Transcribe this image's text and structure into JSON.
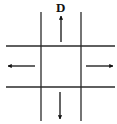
{
  "diagram": {
    "title_label": "D",
    "colors": {
      "line": "#2a2a2a",
      "arrow": "#111111",
      "background": "#ffffff"
    },
    "lines": {
      "vertical": [
        {
          "x": 41,
          "y1": 12,
          "y2": 121
        },
        {
          "x": 81,
          "y1": 12,
          "y2": 121
        }
      ],
      "horizontal": [
        {
          "y": 46,
          "x1": 6,
          "x2": 115
        },
        {
          "y": 87,
          "x1": 6,
          "x2": 115
        }
      ]
    },
    "arrows": [
      {
        "direction": "up",
        "label": "D"
      },
      {
        "direction": "left"
      },
      {
        "direction": "right"
      },
      {
        "direction": "down"
      }
    ]
  }
}
